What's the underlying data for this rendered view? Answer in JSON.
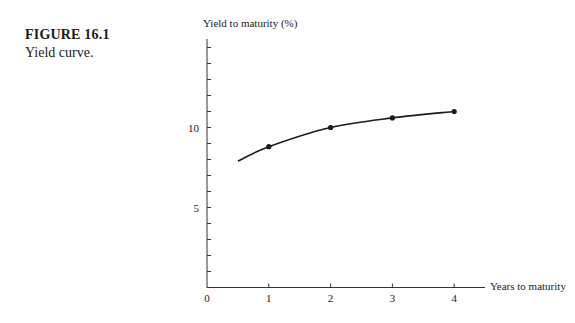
{
  "caption": {
    "figure_number": "FIGURE 16.1",
    "title": "Yield curve."
  },
  "chart_data": {
    "type": "line",
    "title": "Yield curve.",
    "xlabel": "Years to maturity",
    "ylabel": "Yield to maturity (%)",
    "x_ticks": [
      "0",
      "1",
      "2",
      "3",
      "4"
    ],
    "y_tick_labels": [
      "5",
      "10"
    ],
    "y_minor_tick_step": 1,
    "xlim": [
      0,
      5
    ],
    "ylim": [
      0,
      15
    ],
    "grid": false,
    "legend": null,
    "series": [
      {
        "name": "Yield curve",
        "marked_points": [
          {
            "x": 1,
            "y": 8.8
          },
          {
            "x": 2,
            "y": 10.0
          },
          {
            "x": 3,
            "y": 10.6
          },
          {
            "x": 4,
            "y": 11.0
          }
        ],
        "curve_start": {
          "x": 0.5,
          "y": 7.9
        }
      }
    ],
    "line_color": "#1a1a1a"
  }
}
